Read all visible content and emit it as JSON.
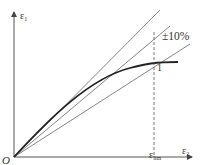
{
  "diagram": {
    "type": "stress-strain style relation with tolerance band",
    "origin_label": "O",
    "y_axis": {
      "label": "ε",
      "subscript": "1"
    },
    "x_axis": {
      "label": "ε",
      "subscript": "2"
    },
    "limit_marker": {
      "label": "ε",
      "subscript": "lim"
    },
    "tolerance_label": "±10%",
    "point_label": "1",
    "lines": [
      {
        "name": "upper-bound-line",
        "style": "thin solid",
        "from": [
          14,
          157
        ],
        "to": [
          160,
          10
        ]
      },
      {
        "name": "nominal-line",
        "style": "thin solid",
        "from": [
          14,
          157
        ],
        "to": [
          170,
          26
        ]
      },
      {
        "name": "lower-bound-line",
        "style": "thin solid",
        "from": [
          14,
          157
        ],
        "to": [
          190,
          44
        ]
      },
      {
        "name": "response-curve",
        "style": "thick solid",
        "from": [
          14,
          157
        ],
        "to": [
          178,
          62
        ]
      },
      {
        "name": "limit-dashed-line",
        "style": "dashed",
        "from": [
          154,
          32
        ],
        "to": [
          154,
          157
        ]
      }
    ],
    "colors": {
      "stroke": "#555555",
      "curve": "#222222",
      "background": "#ffffff"
    }
  }
}
